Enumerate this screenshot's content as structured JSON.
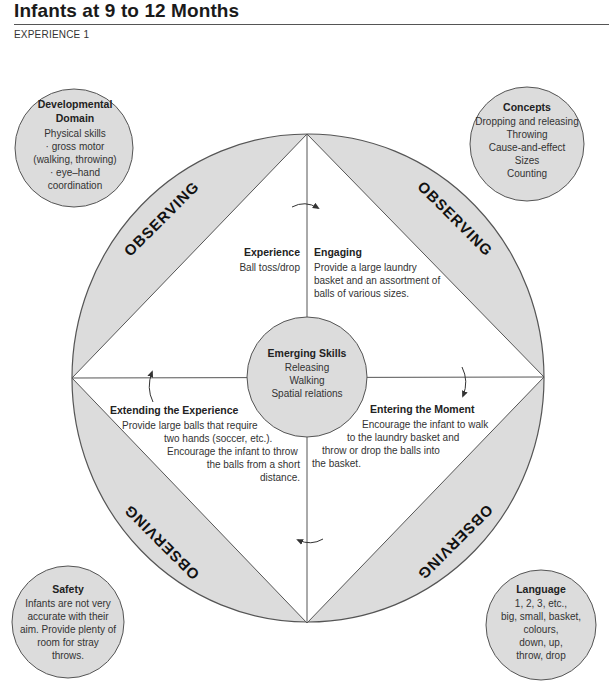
{
  "header": {
    "title": "Infants at 9 to 12 Months",
    "subtitle": "EXPERIENCE 1"
  },
  "colors": {
    "fill_gray": "#dcdcdc",
    "stroke": "#555555",
    "text": "#333333"
  },
  "observing_label": "OBSERVING",
  "center": {
    "title": "Emerging Skills",
    "lines": [
      "Releasing",
      "Walking",
      "Spatial relations"
    ]
  },
  "quadrants": {
    "experience": {
      "title": "Experience",
      "text": "Ball toss/drop"
    },
    "engaging": {
      "title": "Engaging",
      "lines": [
        "Provide a large laundry",
        "basket and an assortment of",
        "balls of various sizes."
      ]
    },
    "entering": {
      "title": "Entering the Moment",
      "lines": [
        "Encourage the infant to walk",
        "to the laundry basket and",
        "throw or drop the balls into",
        "the basket."
      ]
    },
    "extending": {
      "title": "Extending the Experience",
      "lines": [
        "Provide large balls that require",
        "two hands (soccer, etc.).",
        "Encourage the infant to throw",
        "the balls from a short",
        "distance."
      ]
    }
  },
  "bubbles": {
    "developmental": {
      "title_lines": [
        "Developmental",
        "Domain"
      ],
      "lines": [
        "Physical skills",
        "· gross motor",
        "(walking, throwing)",
        "· eye–hand",
        "coordination"
      ]
    },
    "concepts": {
      "title": "Concepts",
      "lines": [
        "Dropping and releasing",
        "Throwing",
        "Cause-and-effect",
        "Sizes",
        "Counting"
      ]
    },
    "safety": {
      "title": "Safety",
      "lines": [
        "Infants are not very",
        "accurate with their",
        "aim. Provide plenty of",
        "room for stray",
        "throws."
      ]
    },
    "language": {
      "title": "Language",
      "lines": [
        "1, 2, 3, etc.,",
        "big, small, basket,",
        "colours,",
        "down, up,",
        "throw, drop"
      ]
    }
  }
}
